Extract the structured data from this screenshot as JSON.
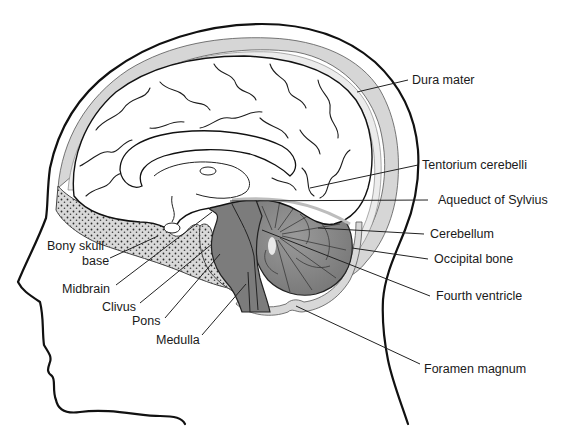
{
  "diagram": {
    "type": "anatomical-midsagittal-head",
    "colors": {
      "background": "#ffffff",
      "outline": "#111111",
      "brain_fill": "#ffffff",
      "brainstem_fill": "#7c7c7c",
      "cerebellum_fill": "#8a8a8a",
      "bone_fill": "#d8d8d8",
      "dura_fill": "#cfcfcf",
      "bone_dots": "#333333"
    },
    "labels": {
      "dura_mater": "Dura mater",
      "tentorium_cerebelli": "Tentorium cerebelli",
      "aqueduct_of_sylvius": "Aqueduct of Sylvius",
      "cerebellum": "Cerebellum",
      "occipital_bone": "Occipital bone",
      "fourth_ventricle": "Fourth ventricle",
      "foramen_magnum": "Foramen magnum",
      "bony_skull_base_1": "Bony skull",
      "bony_skull_base_2": "base",
      "midbrain": "Midbrain",
      "clivus": "Clivus",
      "pons": "Pons",
      "medulla": "Medulla"
    }
  }
}
